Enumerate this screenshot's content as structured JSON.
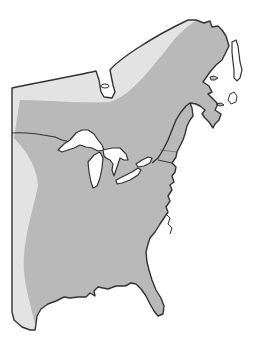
{
  "map": {
    "region": "Eastern North America",
    "description": "Range map showing distribution shading over eastern United States and southeastern Canada",
    "colors": {
      "background": "#ffffff",
      "land_unshaded": "#e2e2e2",
      "range_shading": "#b8b8b8",
      "outline": "#333333",
      "water": "#ffffff"
    },
    "features": {
      "great_lakes": [
        "Lake Superior",
        "Lake Michigan",
        "Lake Huron",
        "Lake Erie",
        "Lake Ontario"
      ],
      "water_bodies": [
        "James Bay",
        "Gulf of St. Lawrence",
        "Gulf of Mexico",
        "Atlantic Ocean"
      ],
      "land_areas": [
        "Quebec",
        "Labrador",
        "Newfoundland",
        "Nova Scotia",
        "Florida"
      ]
    },
    "legend": null
  }
}
